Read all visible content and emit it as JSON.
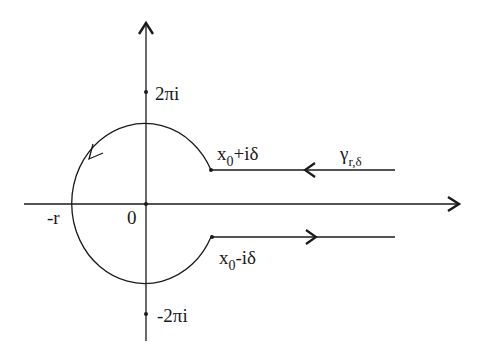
{
  "diagram": {
    "type": "contour-diagram",
    "colors": {
      "ink": "#1a1a1a",
      "background": "#ffffff"
    },
    "labels": {
      "upper_pole": "2πi",
      "lower_pole": "-2πi",
      "origin": "0",
      "neg_r": "-r",
      "upper_endpoint": {
        "base": "x",
        "sub": "0",
        "rest": "+iδ"
      },
      "lower_endpoint": {
        "base": "x",
        "sub": "0",
        "rest": "-iδ"
      },
      "contour_name": {
        "base": "γ",
        "sub": "r,δ"
      }
    }
  }
}
